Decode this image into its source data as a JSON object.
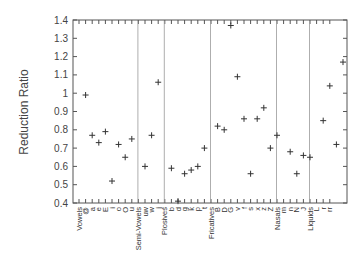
{
  "chart_data": {
    "type": "scatter",
    "title": "",
    "xlabel": "",
    "ylabel": "Reduction Ratio",
    "ylim": [
      0.4,
      1.4
    ],
    "yticks": [
      0.4,
      0.5,
      0.6,
      0.7,
      0.8,
      0.9,
      1,
      1.1,
      1.2,
      1.3,
      1.4
    ],
    "ytick_labels": [
      "0.4",
      "0.5",
      "0.6",
      "0.7",
      "0.8",
      "0.9",
      "1",
      "1.1",
      "1.2",
      "1.3",
      "1.4"
    ],
    "grid": false,
    "legend": null,
    "marker": "+",
    "categories": [
      "Vowels",
      "@",
      "a",
      "e",
      "E",
      "i",
      "o",
      "O",
      "u",
      "Semi-Vowels",
      "uw",
      "w",
      "j",
      "Plosives",
      "b",
      "d",
      "g",
      "k",
      "p",
      "t",
      "Fricatives",
      "B",
      "D",
      "G",
      "v",
      "f",
      "s",
      "x",
      "z",
      "Z",
      "Nasals",
      "m",
      "n",
      "N",
      "J",
      "Liquids",
      "L",
      "r",
      "rr"
    ],
    "group_separators_after": [
      "u",
      "j",
      "t",
      "Z",
      "J"
    ],
    "groups": [
      {
        "name": "Vowels",
        "points": [
          {
            "label": "@",
            "value": 0.99
          },
          {
            "label": "a",
            "value": 0.77
          },
          {
            "label": "e",
            "value": 0.73
          },
          {
            "label": "E",
            "value": 0.79
          },
          {
            "label": "i",
            "value": 0.52
          },
          {
            "label": "o",
            "value": 0.72
          },
          {
            "label": "O",
            "value": 0.65
          },
          {
            "label": "u",
            "value": 0.75
          }
        ]
      },
      {
        "name": "Semi-Vowels",
        "points": [
          {
            "label": "uw",
            "value": 0.6
          },
          {
            "label": "w",
            "value": 0.77
          },
          {
            "label": "j",
            "value": 1.06
          }
        ]
      },
      {
        "name": "Plosives",
        "points": [
          {
            "label": "b",
            "value": 0.59
          },
          {
            "label": "d",
            "value": 0.41
          },
          {
            "label": "g",
            "value": 0.56
          },
          {
            "label": "k",
            "value": 0.58
          },
          {
            "label": "p",
            "value": 0.6
          },
          {
            "label": "t",
            "value": 0.7
          }
        ]
      },
      {
        "name": "Fricatives",
        "points": [
          {
            "label": "B",
            "value": 0.82
          },
          {
            "label": "D",
            "value": 0.8
          },
          {
            "label": "G",
            "value": 1.37
          },
          {
            "label": "v",
            "value": 1.09
          },
          {
            "label": "f",
            "value": 0.86
          },
          {
            "label": "s",
            "value": 0.56
          },
          {
            "label": "x",
            "value": 0.86
          },
          {
            "label": "z",
            "value": 0.92
          },
          {
            "label": "Z",
            "value": 0.7
          },
          {
            "label": "h",
            "value": 0.77
          }
        ]
      },
      {
        "name": "Nasals",
        "points": [
          {
            "label": "m",
            "value": 0.68
          },
          {
            "label": "n",
            "value": 0.56
          },
          {
            "label": "N",
            "value": 0.66
          },
          {
            "label": "J",
            "value": 0.65
          }
        ]
      },
      {
        "name": "Liquids",
        "points": [
          {
            "label": "l",
            "value": 0.85
          },
          {
            "label": "L",
            "value": 1.04
          },
          {
            "label": "r",
            "value": 0.72
          },
          {
            "label": "rr",
            "value": 1.17
          }
        ]
      }
    ]
  },
  "axis": {
    "ylabel": "Reduction Ratio"
  },
  "colors": {
    "axis": "#555555",
    "marker": "#333333",
    "separator": "#999999"
  }
}
